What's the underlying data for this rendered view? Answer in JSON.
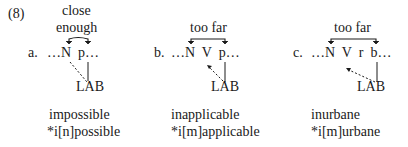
{
  "example_number": "(8)",
  "panels": [
    {
      "id": "a",
      "label": "a.",
      "annotation_line1": "close",
      "annotation_line2": "enough",
      "sequence": "…N  p…",
      "feature": "LAB",
      "word": "impossible",
      "ungrammatical": "*i[n]possible"
    },
    {
      "id": "b",
      "label": "b.",
      "annotation_line1": "too far",
      "sequence": "…N  V  p…",
      "feature": "LAB",
      "word": "inapplicable",
      "ungrammatical": "*i[m]applicable"
    },
    {
      "id": "c",
      "label": "c.",
      "annotation_line1": "too far",
      "sequence": "…N  V  r  b…",
      "feature": "LAB",
      "word": "inurbane",
      "ungrammatical": "*i[m]urbane"
    }
  ],
  "colors": {
    "ink": "#1a1a1a",
    "background": "#ffffff"
  }
}
